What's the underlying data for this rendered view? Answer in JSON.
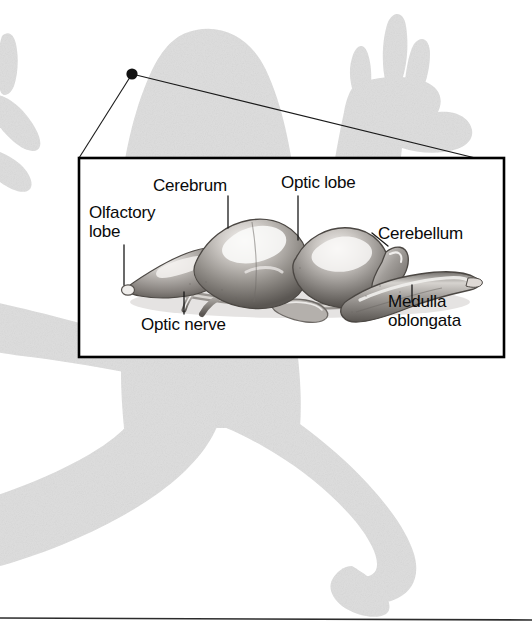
{
  "figure": {
    "type": "anatomical-diagram",
    "background_silhouette": "frog-silhouette",
    "silhouette_color": "#dedede",
    "callout": {
      "origin_marker": "callout-dot",
      "box_border_color": "#000000",
      "box_fill": "#ffffff"
    },
    "illustration": {
      "name": "frog-brain-illustration",
      "style": "grayscale airbrush rendering",
      "palette": {
        "dark": "#595552",
        "mid": "#8d8a86",
        "light": "#c9c6c2",
        "highlight": "#f2f0ee",
        "outline": "#3a3836"
      }
    },
    "divider_color": "#2b2b2b"
  },
  "labels": {
    "olfactory_lobe": "Olfactory\nlobe",
    "cerebrum": "Cerebrum",
    "optic_lobe": "Optic lobe",
    "cerebellum": "Cerebellum",
    "optic_nerve": "Optic nerve",
    "medulla_oblongata": "Medulla\noblongata"
  }
}
